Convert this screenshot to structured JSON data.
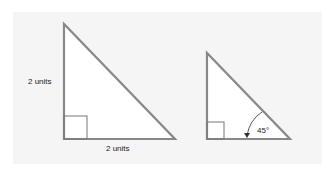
{
  "diagram": {
    "background_color": "#f5f5f5",
    "stroke_color": "#888888",
    "triangle_large": {
      "left_side_label": "2 units",
      "bottom_side_label": "2 units",
      "right_angle_marker": true
    },
    "triangle_small": {
      "angle_label": "45°",
      "right_angle_marker": true
    }
  }
}
